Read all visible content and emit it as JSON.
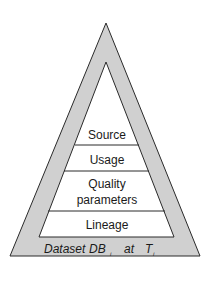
{
  "diagram": {
    "type": "pyramid",
    "layers": [
      {
        "label": "Source"
      },
      {
        "label_line1": "Usage"
      },
      {
        "label_line1": "Quality",
        "label_line2": "parameters"
      },
      {
        "label_line1": "Lineage"
      }
    ],
    "base": {
      "prefix": "Dataset",
      "db": "DB",
      "db_sub": "i",
      "at": "at",
      "t": "T",
      "t_sub": "i"
    },
    "colors": {
      "outer_fill": "#d0d0d0",
      "inner_fill": "#ffffff",
      "stroke": "#2a2a2a"
    }
  }
}
